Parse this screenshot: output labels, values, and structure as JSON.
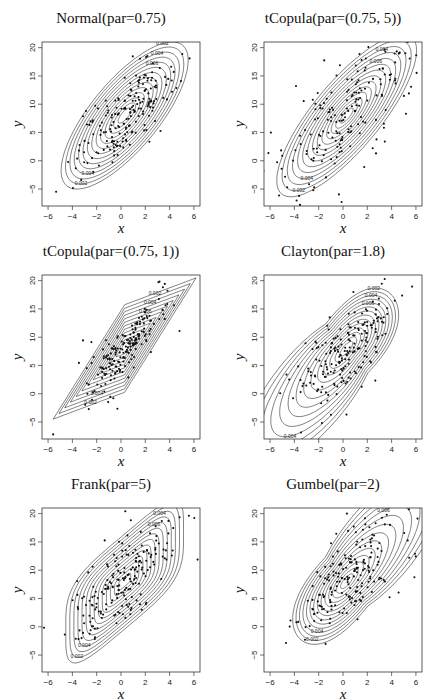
{
  "figure": {
    "layout": {
      "rows": 3,
      "cols": 2
    },
    "colors": {
      "line": "#1a1a1a",
      "point": "#111111",
      "box": "#333333",
      "background": "#ffffff"
    }
  },
  "chart_data": [
    {
      "type": "scatter",
      "overlay": "contour",
      "title": "Normal(par=0.75)",
      "xlabel": "x",
      "ylabel": "y",
      "xlim": [
        -6.5,
        6.5
      ],
      "ylim": [
        -8,
        21
      ],
      "xticks": [
        -6,
        -4,
        -2,
        0,
        2,
        4,
        6
      ],
      "yticks": [
        -5,
        0,
        5,
        10,
        15,
        20
      ],
      "grid": false,
      "contour_levels_labeled": [
        "0.002",
        "0.004",
        "0.006",
        "0.008",
        "0.01",
        "0.012",
        "0.014"
      ],
      "shape": "ellipse",
      "center": [
        0.3,
        8
      ],
      "sx": 2.05,
      "sy": 5.1,
      "rho": 0.75,
      "n_points": 200
    },
    {
      "type": "scatter",
      "overlay": "contour",
      "title": "tCopula(par=(0.75, 5))",
      "xlabel": "x",
      "ylabel": "y",
      "xlim": [
        -6.5,
        6.5
      ],
      "ylim": [
        -8,
        21
      ],
      "xticks": [
        -6,
        -4,
        -2,
        0,
        2,
        4,
        6
      ],
      "yticks": [
        -5,
        0,
        5,
        10,
        15,
        20
      ],
      "grid": false,
      "contour_levels_labeled": [
        "0.002",
        "0.004",
        "0.006",
        "0.008",
        "0.01",
        "0.012"
      ],
      "shape": "t-ellipse",
      "center": [
        0.3,
        8
      ],
      "sx": 2.0,
      "sy": 5.0,
      "rho": 0.8,
      "n_points": 200
    },
    {
      "type": "scatter",
      "overlay": "contour",
      "title": "tCopula(par=(0.75, 1))",
      "xlabel": "x",
      "ylabel": "y",
      "xlim": [
        -6.5,
        6.5
      ],
      "ylim": [
        -8,
        21
      ],
      "xticks": [
        -6,
        -4,
        -2,
        0,
        2,
        4,
        6
      ],
      "yticks": [
        -5,
        0,
        5,
        10,
        15,
        20
      ],
      "grid": false,
      "contour_levels_labeled": [
        "0.002",
        "0.004",
        "0.006",
        "0.008"
      ],
      "shape": "diamond",
      "center": [
        0.3,
        8
      ],
      "sx": 2.0,
      "sy": 5.0,
      "rho": 0.85,
      "n_points": 200
    },
    {
      "type": "scatter",
      "overlay": "contour",
      "title": "Clayton(par=1.8)",
      "xlabel": "x",
      "ylabel": "y",
      "xlim": [
        -6.5,
        6.5
      ],
      "ylim": [
        -8,
        21
      ],
      "xticks": [
        -6,
        -4,
        -2,
        0,
        2,
        4,
        6
      ],
      "yticks": [
        -5,
        0,
        5,
        10,
        15,
        20
      ],
      "grid": false,
      "contour_levels_labeled": [
        "0.002",
        "0.004",
        "0.006",
        "0.008",
        "0.01"
      ],
      "shape": "teardrop-lower",
      "center": [
        0.3,
        8
      ],
      "sx": 2.0,
      "sy": 5.0,
      "rho": 0.75,
      "n_points": 200
    },
    {
      "type": "scatter",
      "overlay": "contour",
      "title": "Frank(par=5)",
      "xlabel": "x",
      "ylabel": "y",
      "xlim": [
        -6.5,
        6.5
      ],
      "ylim": [
        -8,
        21
      ],
      "xticks": [
        -6,
        -4,
        -2,
        0,
        2,
        4,
        6
      ],
      "yticks": [
        -5,
        0,
        5,
        10,
        15,
        20
      ],
      "grid": false,
      "contour_levels_labeled": [
        "0.002",
        "0.004",
        "0.006",
        "0.008",
        "0.01",
        "0.012"
      ],
      "shape": "capsule",
      "center": [
        0.3,
        8
      ],
      "sx": 2.0,
      "sy": 5.0,
      "rho": 0.72,
      "n_points": 200
    },
    {
      "type": "scatter",
      "overlay": "contour",
      "title": "Gumbel(par=2)",
      "xlabel": "x",
      "ylabel": "y",
      "xlim": [
        -6.5,
        6.5
      ],
      "ylim": [
        -8,
        21
      ],
      "xticks": [
        -6,
        -4,
        -2,
        0,
        2,
        4,
        6
      ],
      "yticks": [
        -5,
        0,
        5,
        10,
        15,
        20
      ],
      "grid": false,
      "contour_levels_labeled": [
        "0.002",
        "0.004",
        "0.006",
        "0.008",
        "0.01"
      ],
      "shape": "teardrop-upper",
      "center": [
        0.3,
        8
      ],
      "sx": 2.0,
      "sy": 5.0,
      "rho": 0.75,
      "n_points": 200
    }
  ]
}
